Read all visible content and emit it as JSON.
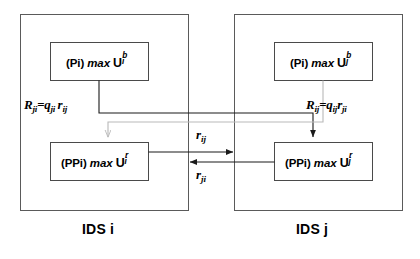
{
  "diagram": {
    "type": "block-diagram",
    "background_color": "#ffffff",
    "line_color": "#1a1a1a",
    "gray_line_color": "#b3b3b3",
    "outer_panels": [
      {
        "id": "panel-i",
        "caption": "IDS i",
        "x": 20,
        "y": 14,
        "w": 168,
        "h": 196
      },
      {
        "id": "panel-j",
        "caption": "IDS j",
        "x": 234,
        "y": 14,
        "w": 168,
        "h": 196
      }
    ],
    "inner_boxes": [
      {
        "id": "box-pi-i",
        "prefix": "(Pi)",
        "operator": "max",
        "symbol": "U",
        "subscript": "i",
        "superscript": "b",
        "text": "(Pi) max U i b",
        "x": 50,
        "y": 42,
        "w": 98,
        "h": 38
      },
      {
        "id": "box-ppi-i",
        "prefix": "(PPi)",
        "operator": "max",
        "symbol": "U",
        "subscript": "i",
        "superscript": "r",
        "text": "(PPi) max U i r",
        "x": 50,
        "y": 142,
        "w": 98,
        "h": 38
      },
      {
        "id": "box-pi-j",
        "prefix": "(Pi)",
        "operator": "max",
        "symbol": "U",
        "subscript": "j",
        "superscript": "b",
        "text": "(Pi) max U j b",
        "x": 274,
        "y": 42,
        "w": 98,
        "h": 38
      },
      {
        "id": "box-ppi-j",
        "prefix": "(PPi)",
        "operator": "max",
        "symbol": "U",
        "subscript": "j",
        "superscript": "r",
        "text": "(PPi) max U j r",
        "x": 274,
        "y": 142,
        "w": 98,
        "h": 38
      }
    ],
    "equation_labels": [
      {
        "id": "eq-left",
        "lhs": "R",
        "lhs_sub": "ji",
        "rhs_q": "q",
        "rhs_q_sub": "ji",
        "rhs_r": "r",
        "rhs_r_sub": "ij",
        "text": "R_ji = q_ji r_ij",
        "x": 24,
        "y": 98
      },
      {
        "id": "eq-right",
        "lhs": "R",
        "lhs_sub": "ij",
        "rhs_q": "q",
        "rhs_q_sub": "ij",
        "rhs_r": "r",
        "rhs_r_sub": "ji",
        "text": "R_ij = q_ij r_ji",
        "x": 306,
        "y": 98
      }
    ],
    "flow_labels": [
      {
        "id": "flow-rij",
        "symbol": "r",
        "subscript": "ij",
        "text": "r_ij",
        "x": 196,
        "y": 131,
        "direction": "left-to-right"
      },
      {
        "id": "flow-rji",
        "symbol": "r",
        "subscript": "ji",
        "text": "r_ji",
        "x": 196,
        "y": 170,
        "direction": "right-to-left"
      }
    ],
    "captions": [
      {
        "id": "caption-ids-i",
        "text": "IDS i",
        "x": 78,
        "y": 222
      },
      {
        "id": "caption-ids-j",
        "text": "IDS j",
        "x": 292,
        "y": 222
      }
    ]
  }
}
